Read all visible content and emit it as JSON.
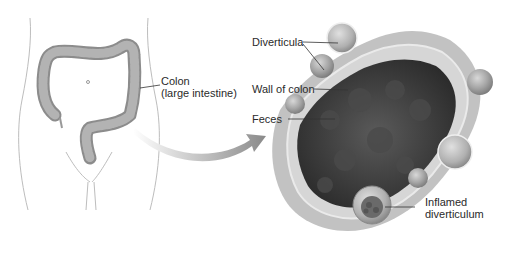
{
  "diagram": {
    "type": "anatomical-illustration",
    "left_panel": {
      "labels": [
        {
          "id": "colon",
          "line1": "Colon",
          "line2": "(large intestine)"
        }
      ]
    },
    "right_panel": {
      "labels": [
        {
          "id": "diverticula",
          "text": "Diverticula"
        },
        {
          "id": "wall",
          "text": "Wall of colon"
        },
        {
          "id": "feces",
          "text": "Feces"
        },
        {
          "id": "inflamed",
          "line1": "Inflamed",
          "line2": "diverticulum"
        }
      ]
    },
    "colors": {
      "outline": "#b5b5b5",
      "colon_fill": "#9a9a9a",
      "arrow": "#8a8a8a",
      "tissue": "#c4c4c4",
      "feces": "#3a3a3a",
      "text": "#2a2a2a"
    }
  }
}
